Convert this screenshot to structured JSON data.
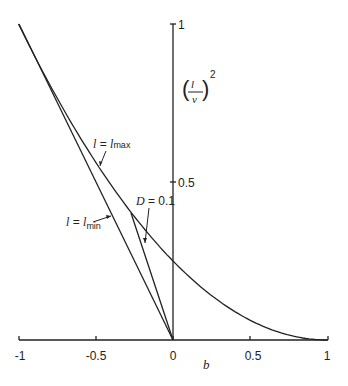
{
  "chart_data": {
    "type": "line",
    "title": "",
    "xlabel": "b",
    "ylabel": "(l/v)^2",
    "xlim": [
      -1,
      1
    ],
    "ylim": [
      0,
      1
    ],
    "x_ticks": [
      -1,
      -0.5,
      0,
      0.5,
      1
    ],
    "x_tick_labels": [
      "-1",
      "-0.5",
      "0",
      "0.5",
      "1"
    ],
    "y_ticks": [
      0.5,
      1
    ],
    "y_tick_labels": [
      "0.5",
      "1"
    ],
    "grid": false,
    "legend": null,
    "series": [
      {
        "name": "l = l_max",
        "formula": "((1-b)/2)^2",
        "x": [
          -1,
          -0.75,
          -0.5,
          -0.27,
          0,
          0.25,
          0.5,
          0.75,
          1
        ],
        "y": [
          1.0,
          0.766,
          0.5625,
          0.403,
          0.25,
          0.141,
          0.0625,
          0.016,
          0.0
        ]
      },
      {
        "name": "l = l_min",
        "formula": "-b",
        "x": [
          -1,
          0
        ],
        "y": [
          1,
          0
        ]
      },
      {
        "name": "D = 0.1",
        "x": [
          -0.27,
          0
        ],
        "y": [
          0.403,
          0
        ]
      }
    ],
    "annotations": [
      {
        "text": "l = l_max",
        "points_to": "upper curve",
        "at": [
          -0.5,
          0.56
        ]
      },
      {
        "text": "l = l_min",
        "points_to": "straight line from (-1,1) to (0,0)",
        "at": [
          -0.37,
          0.37
        ]
      },
      {
        "text": "D = 0.1",
        "points_to": "short line from curve to origin",
        "at": [
          -0.18,
          0.34
        ]
      }
    ]
  },
  "labels": {
    "y_axis_base": "l",
    "y_axis_denom": "v",
    "y_axis_exp": "2",
    "x_axis": "b",
    "lmax_left": "l",
    "lmax_eq": " = ",
    "lmax_right": "l",
    "lmax_sub": "max",
    "lmin_left": "l",
    "lmin_eq": " = ",
    "lmin_right": "l",
    "lmin_sub": "min",
    "d_label": "D",
    "d_eq": " = 0.1"
  }
}
